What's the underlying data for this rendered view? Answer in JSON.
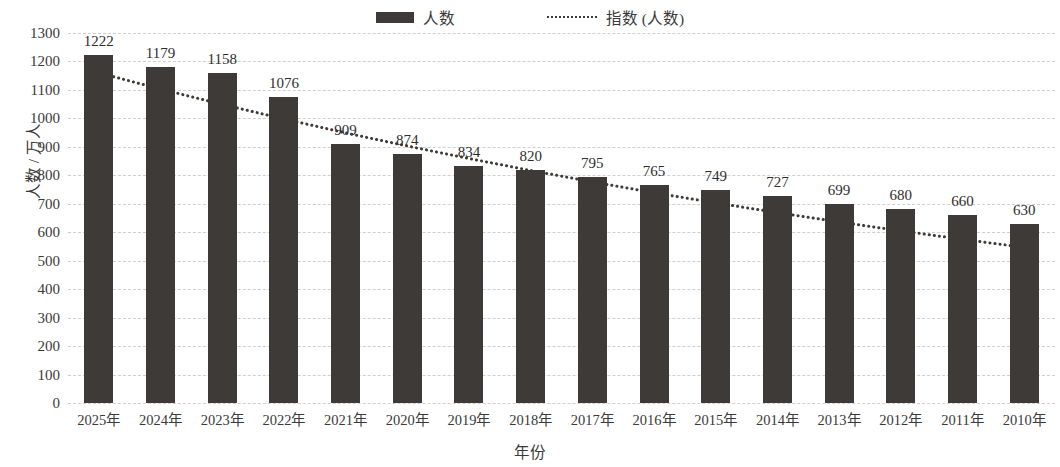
{
  "chart_data": {
    "type": "bar",
    "title": "",
    "subtitle": "",
    "xlabel": "年份",
    "ylabel": "人数 / 万人",
    "categories": [
      "2025年",
      "2024年",
      "2023年",
      "2022年",
      "2021年",
      "2020年",
      "2019年",
      "2018年",
      "2017年",
      "2016年",
      "2015年",
      "2014年",
      "2013年",
      "2012年",
      "2011年",
      "2010年"
    ],
    "series": [
      {
        "name": "人数",
        "type": "bar",
        "color": "#3e3a37",
        "values": [
          1222,
          1179,
          1158,
          1076,
          909,
          874,
          834,
          820,
          795,
          765,
          749,
          727,
          699,
          680,
          660,
          630
        ]
      },
      {
        "name": "指数 (人数)",
        "type": "trendline",
        "style": "dotted",
        "color": "#3e3a37",
        "values": [
          1160,
          1103,
          1049,
          998,
          949,
          903,
          859,
          817,
          777,
          739,
          703,
          669,
          636,
          605,
          575,
          547
        ]
      }
    ],
    "data_labels": [
      1222,
      1179,
      1158,
      1076,
      909,
      874,
      834,
      820,
      795,
      765,
      749,
      727,
      699,
      680,
      660,
      630
    ],
    "ylim": [
      0,
      1300
    ],
    "ytick_step": 100,
    "yticks": [
      0,
      100,
      200,
      300,
      400,
      500,
      600,
      700,
      800,
      900,
      1000,
      1100,
      1200,
      1300
    ],
    "ytick_labels": [
      "0",
      "100",
      "200",
      "300",
      "400",
      "500",
      "600",
      "700",
      "800",
      "900",
      "1000",
      "1100",
      "1200",
      "1300"
    ],
    "grid": true,
    "grid_style": "dashed",
    "grid_color": "#cfcfcf",
    "legend_position": "top-center",
    "legend": [
      "人数",
      "指数 (人数)"
    ],
    "background": "#ffffff"
  },
  "legend": {
    "bar_label": "人数",
    "trend_label": "指数 (人数)"
  },
  "axes": {
    "y_title": "人数 / 万人",
    "x_title": "年份"
  }
}
